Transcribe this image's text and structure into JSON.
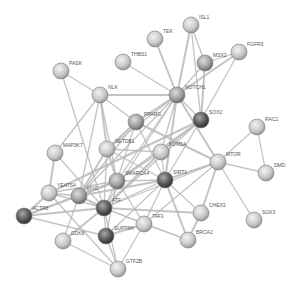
{
  "network": {
    "title": "protein interaction network",
    "node_radius": 8,
    "edge_color": "#b8b8b8",
    "nodes": [
      {
        "id": "ISL1",
        "x": 191,
        "y": 25,
        "shade": "light"
      },
      {
        "id": "TEK",
        "x": 155,
        "y": 39,
        "shade": "light"
      },
      {
        "id": "THBS1",
        "x": 123,
        "y": 62,
        "shade": "light"
      },
      {
        "id": "FGFR3",
        "x": 239,
        "y": 52,
        "shade": "light"
      },
      {
        "id": "MSX2",
        "x": 205,
        "y": 63,
        "shade": "mid"
      },
      {
        "id": "PASK",
        "x": 61,
        "y": 71,
        "shade": "light"
      },
      {
        "id": "NOTCH1",
        "x": 177,
        "y": 95,
        "shade": "mid"
      },
      {
        "id": "NLK",
        "x": 100,
        "y": 95,
        "shade": "light"
      },
      {
        "id": "PPARG",
        "x": 136,
        "y": 122,
        "shade": "mid"
      },
      {
        "id": "SOX2",
        "x": 201,
        "y": 120,
        "shade": "dark"
      },
      {
        "id": "RAC1",
        "x": 257,
        "y": 127,
        "shade": "light"
      },
      {
        "id": "MAP3K7",
        "x": 55,
        "y": 153,
        "shade": "light"
      },
      {
        "id": "SETDB1",
        "x": 107,
        "y": 149,
        "shade": "light"
      },
      {
        "id": "KDM1A",
        "x": 161,
        "y": 152,
        "shade": "light"
      },
      {
        "id": "MTOR",
        "x": 218,
        "y": 162,
        "shade": "light"
      },
      {
        "id": "DMD",
        "x": 266,
        "y": 173,
        "shade": "light"
      },
      {
        "id": "SMARCA4",
        "x": 117,
        "y": 181,
        "shade": "mid"
      },
      {
        "id": "SIRT1",
        "x": 165,
        "y": 180,
        "shade": "dark"
      },
      {
        "id": "YEATS4",
        "x": 49,
        "y": 193,
        "shade": "light"
      },
      {
        "id": "MYC",
        "x": 79,
        "y": 196,
        "shade": "mid"
      },
      {
        "id": "ATF",
        "x": 104,
        "y": 208,
        "shade": "dark"
      },
      {
        "id": "ACTR8",
        "x": 24,
        "y": 216,
        "shade": "dark"
      },
      {
        "id": "TAF1",
        "x": 144,
        "y": 224,
        "shade": "light"
      },
      {
        "id": "CHEX2",
        "x": 201,
        "y": 213,
        "shade": "light"
      },
      {
        "id": "SGK3",
        "x": 254,
        "y": 220,
        "shade": "light"
      },
      {
        "id": "SUPT6H",
        "x": 106,
        "y": 236,
        "shade": "dark"
      },
      {
        "id": "CDK8",
        "x": 63,
        "y": 241,
        "shade": "light"
      },
      {
        "id": "BRCA2",
        "x": 188,
        "y": 240,
        "shade": "light"
      },
      {
        "id": "GTF2B",
        "x": 118,
        "y": 269,
        "shade": "light"
      }
    ],
    "edges": [
      [
        "ISL1",
        "NOTCH1"
      ],
      [
        "ISL1",
        "MSX2"
      ],
      [
        "ISL1",
        "SOX2"
      ],
      [
        "TEK",
        "NOTCH1"
      ],
      [
        "THBS1",
        "NOTCH1"
      ],
      [
        "FGFR3",
        "MSX2"
      ],
      [
        "FGFR3",
        "NOTCH1"
      ],
      [
        "FGFR3",
        "SOX2"
      ],
      [
        "MSX2",
        "NOTCH1"
      ],
      [
        "MSX2",
        "SOX2"
      ],
      [
        "PASK",
        "NLK"
      ],
      [
        "PASK",
        "ATF"
      ],
      [
        "NLK",
        "NOTCH1"
      ],
      [
        "NLK",
        "PPARG"
      ],
      [
        "NLK",
        "MAP3K7"
      ],
      [
        "NLK",
        "SETDB1"
      ],
      [
        "NLK",
        "SMARCA4"
      ],
      [
        "NLK",
        "MYC"
      ],
      [
        "NOTCH1",
        "PPARG"
      ],
      [
        "NOTCH1",
        "SOX2"
      ],
      [
        "NOTCH1",
        "KDM1A"
      ],
      [
        "NOTCH1",
        "SIRT1"
      ],
      [
        "NOTCH1",
        "SMARCA4"
      ],
      [
        "NOTCH1",
        "SETDB1"
      ],
      [
        "NOTCH1",
        "MTOR"
      ],
      [
        "NOTCH1",
        "ATF"
      ],
      [
        "NOTCH1",
        "MYC"
      ],
      [
        "SOX2",
        "SMARCA4"
      ],
      [
        "SOX2",
        "KDM1A"
      ],
      [
        "SOX2",
        "SIRT1"
      ],
      [
        "SOX2",
        "YEATS4"
      ],
      [
        "SOX2",
        "ATF"
      ],
      [
        "PPARG",
        "SIRT1"
      ],
      [
        "PPARG",
        "SETDB1"
      ],
      [
        "PPARG",
        "MYC"
      ],
      [
        "PPARG",
        "SMARCA4"
      ],
      [
        "PPARG",
        "MTOR"
      ],
      [
        "RAC1",
        "DMD"
      ],
      [
        "RAC1",
        "MTOR"
      ],
      [
        "MTOR",
        "SIRT1"
      ],
      [
        "MTOR",
        "DMD"
      ],
      [
        "MTOR",
        "SGK3"
      ],
      [
        "MTOR",
        "CHEX2"
      ],
      [
        "MTOR",
        "ATF"
      ],
      [
        "MTOR",
        "TAF1"
      ],
      [
        "MAP3K7",
        "YEATS4"
      ],
      [
        "MAP3K7",
        "ATF"
      ],
      [
        "SETDB1",
        "KDM1A"
      ],
      [
        "SETDB1",
        "SMARCA4"
      ],
      [
        "SETDB1",
        "ATF"
      ],
      [
        "SETDB1",
        "SIRT1"
      ],
      [
        "SETDB1",
        "MYC"
      ],
      [
        "KDM1A",
        "SIRT1"
      ],
      [
        "KDM1A",
        "SMARCA4"
      ],
      [
        "KDM1A",
        "ATF"
      ],
      [
        "SMARCA4",
        "SIRT1"
      ],
      [
        "SMARCA4",
        "ATF"
      ],
      [
        "SMARCA4",
        "MYC"
      ],
      [
        "SMARCA4",
        "YEATS4"
      ],
      [
        "SMARCA4",
        "TAF1"
      ],
      [
        "SMARCA4",
        "ACTR8"
      ],
      [
        "SMARCA4",
        "SUPT6H"
      ],
      [
        "SIRT1",
        "ATF"
      ],
      [
        "SIRT1",
        "MYC"
      ],
      [
        "SIRT1",
        "TAF1"
      ],
      [
        "SIRT1",
        "CHEX2"
      ],
      [
        "SIRT1",
        "BRCA2"
      ],
      [
        "SIRT1",
        "SUPT6H"
      ],
      [
        "YEATS4",
        "MYC"
      ],
      [
        "YEATS4",
        "ACTR8"
      ],
      [
        "YEATS4",
        "ATF"
      ],
      [
        "YEATS4",
        "GTF2B"
      ],
      [
        "MYC",
        "ATF"
      ],
      [
        "MYC",
        "ACTR8"
      ],
      [
        "MYC",
        "CDK8"
      ],
      [
        "ATF",
        "ACTR8"
      ],
      [
        "ATF",
        "SUPT6H"
      ],
      [
        "ATF",
        "TAF1"
      ],
      [
        "ATF",
        "CHEX2"
      ],
      [
        "ATF",
        "BRCA2"
      ],
      [
        "ATF",
        "GTF2B"
      ],
      [
        "TAF1",
        "SUPT6H"
      ],
      [
        "TAF1",
        "GTF2B"
      ],
      [
        "TAF1",
        "BRCA2"
      ],
      [
        "CHEX2",
        "BRCA2"
      ],
      [
        "SUPT6H",
        "GTF2B"
      ],
      [
        "CDK8",
        "GTF2B"
      ],
      [
        "CDK8",
        "ATF"
      ],
      [
        "ACTR8",
        "SUPT6H"
      ]
    ]
  }
}
